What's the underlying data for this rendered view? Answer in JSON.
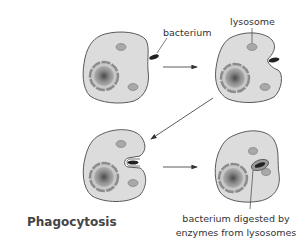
{
  "title": "Phagocytosis",
  "labels": {
    "bacterium": "bacterium",
    "lysosome": "lysosome",
    "caption_line1": "bacterium digested by",
    "caption_line2": "enzymes from lysosomes"
  },
  "colors": {
    "cell_fill": "#dcdcdc",
    "cell_stroke": "#5a5a5a",
    "lysosome_fill": "#a8a8a8",
    "bacterium": "#222222",
    "nucleus_ring": "#8c8c8c",
    "nucleus_core": "#6a6a6a",
    "arrow": "#333333",
    "text": "#333333"
  },
  "stages": [
    {
      "step": 1,
      "description": "cell with bacterium approaching"
    },
    {
      "step": 2,
      "description": "cell membrane begins to surround bacterium"
    },
    {
      "step": 3,
      "description": "bacterium engulfed into pocket"
    },
    {
      "step": 4,
      "description": "bacterium digested by enzymes from lysosomes"
    }
  ]
}
